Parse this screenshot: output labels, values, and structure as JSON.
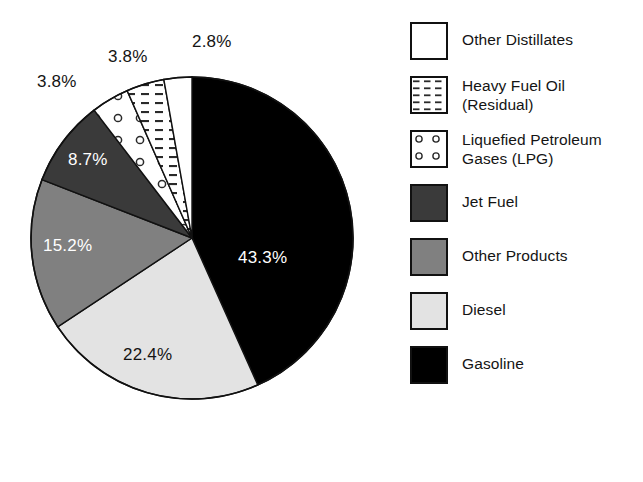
{
  "chart_data": {
    "type": "pie",
    "title": "",
    "subtitle": "",
    "xlabel": "",
    "ylabel": "",
    "legend_position": "right",
    "grid": false,
    "units": "percent",
    "start_angle_deg": 0,
    "direction": "clockwise",
    "categories": [
      "Gasoline",
      "Diesel",
      "Other Products",
      "Jet Fuel",
      "Liquefied Petroleum Gases (LPG)",
      "Heavy Fuel Oil (Residual)",
      "Other Distillates"
    ],
    "values": [
      43.3,
      22.4,
      15.2,
      8.7,
      3.8,
      3.8,
      2.8
    ],
    "slices": [
      {
        "label": "Gasoline",
        "value": 43.3,
        "display": "43.3%",
        "fill": "#000000",
        "pattern": "solid",
        "label_color": "#ffffff",
        "label_placement": "inside"
      },
      {
        "label": "Diesel",
        "value": 22.4,
        "display": "22.4%",
        "fill": "#e3e3e3",
        "pattern": "solid",
        "label_color": "#141414",
        "label_placement": "inside"
      },
      {
        "label": "Other Products",
        "value": 15.2,
        "display": "15.2%",
        "fill": "#808080",
        "pattern": "solid",
        "label_color": "#ffffff",
        "label_placement": "inside"
      },
      {
        "label": "Jet Fuel",
        "value": 8.7,
        "display": "8.7%",
        "fill": "#3a3a3a",
        "pattern": "solid",
        "label_color": "#ffffff",
        "label_placement": "inside"
      },
      {
        "label": "Liquefied Petroleum Gases (LPG)",
        "value": 3.8,
        "display": "3.8%",
        "fill": "#ffffff",
        "pattern": "circles",
        "label_color": "#141414",
        "label_placement": "outside"
      },
      {
        "label": "Heavy Fuel Oil (Residual)",
        "value": 3.8,
        "display": "3.8%",
        "fill": "#ffffff",
        "pattern": "dashes",
        "label_color": "#141414",
        "label_placement": "outside"
      },
      {
        "label": "Other Distillates",
        "value": 2.8,
        "display": "2.8%",
        "fill": "#ffffff",
        "pattern": "solid",
        "label_color": "#141414",
        "label_placement": "outside"
      }
    ]
  },
  "pie_labels": {
    "gasoline": "43.3%",
    "diesel": "22.4%",
    "other_products": "15.2%",
    "jet_fuel": "8.7%",
    "lpg": "3.8%",
    "heavy_fuel_oil": "3.8%",
    "other_distillates": "2.8%"
  },
  "legend": {
    "items": [
      {
        "label": "Other Distillates",
        "pattern": "solid-white",
        "fill": "#ffffff"
      },
      {
        "label": "Heavy Fuel Oil\n(Residual)",
        "pattern": "dashes",
        "fill": "#ffffff"
      },
      {
        "label": "Liquefied Petroleum\nGases (LPG)",
        "pattern": "circles",
        "fill": "#ffffff"
      },
      {
        "label": "Jet Fuel",
        "pattern": "solid",
        "fill": "#3a3a3a"
      },
      {
        "label": "Other Products",
        "pattern": "solid",
        "fill": "#808080"
      },
      {
        "label": "Diesel",
        "pattern": "solid",
        "fill": "#e3e3e3"
      },
      {
        "label": "Gasoline",
        "pattern": "solid",
        "fill": "#000000"
      }
    ]
  },
  "colors": {
    "gasoline": "#000000",
    "diesel": "#e3e3e3",
    "other_products": "#808080",
    "jet_fuel": "#3a3a3a",
    "outline": "#111111",
    "background": "#ffffff",
    "text": "#141414"
  }
}
